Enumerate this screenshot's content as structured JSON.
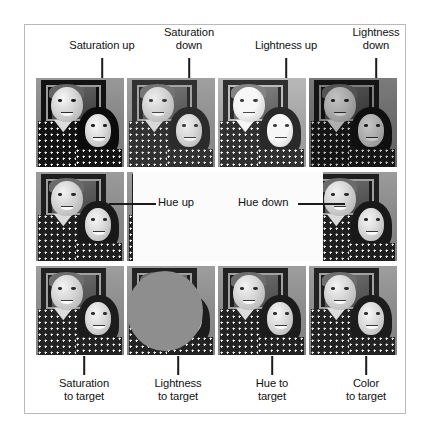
{
  "figure": {
    "caption_top": [
      {
        "id": "saturation-up",
        "label": "Saturation up",
        "line_x": 101,
        "label_x": 101
      },
      {
        "id": "saturation-down",
        "label": "Saturation\ndown",
        "line_x": 188,
        "label_x": 188
      },
      {
        "id": "lightness-up",
        "label": "Lightness up",
        "line_x": 285,
        "label_x": 285
      },
      {
        "id": "lightness-down",
        "label": "Lightness\ndown",
        "line_x": 375,
        "label_x": 375
      }
    ],
    "caption_bottom": [
      {
        "id": "saturation-to-target",
        "label": "Saturation\nto target",
        "line_x": 83,
        "label_x": 83
      },
      {
        "id": "lightness-to-target",
        "label": "Lightness\nto target",
        "line_x": 177,
        "label_x": 177
      },
      {
        "id": "hue-to-target",
        "label": "Hue to\ntarget",
        "line_x": 271,
        "label_x": 271
      },
      {
        "id": "color-to-target",
        "label": "Color\nto target",
        "line_x": 365,
        "label_x": 365
      }
    ],
    "caption_middle": [
      {
        "id": "hue-up",
        "label": "Hue up"
      },
      {
        "id": "hue-down",
        "label": "Hue down"
      }
    ],
    "grid": {
      "rows": 3,
      "cols": 4,
      "cells": [
        [
          {
            "id": "r0c0",
            "tone": "tone-sat-up"
          },
          {
            "id": "r0c1",
            "tone": "tone-sat-down"
          },
          {
            "id": "r0c2",
            "tone": "tone-light-up"
          },
          {
            "id": "r0c3",
            "tone": "tone-light-dn"
          }
        ],
        [
          {
            "id": "r1c0",
            "tone": "tone-hue"
          },
          {
            "id": "r1c1",
            "tone": "tone-hue"
          },
          {
            "id": "r1c2",
            "tone": "tone-hue"
          },
          {
            "id": "r1c3",
            "tone": "tone-hue"
          }
        ],
        [
          {
            "id": "r2c0",
            "tone": "tone-target"
          },
          {
            "id": "r2c1",
            "tone": "tone-target"
          },
          {
            "id": "r2c2",
            "tone": "tone-target"
          },
          {
            "id": "r2c3",
            "tone": "tone-target"
          }
        ]
      ]
    },
    "colors": {
      "frame_border": "#b9b9b9",
      "leader_line": "#1b1b1b",
      "text": "#111111",
      "overlay_white": "#fbfbfb",
      "overlay_ellipse_gray": "#8e8e8e",
      "photo_background_gray": "#8d8d8d"
    }
  }
}
